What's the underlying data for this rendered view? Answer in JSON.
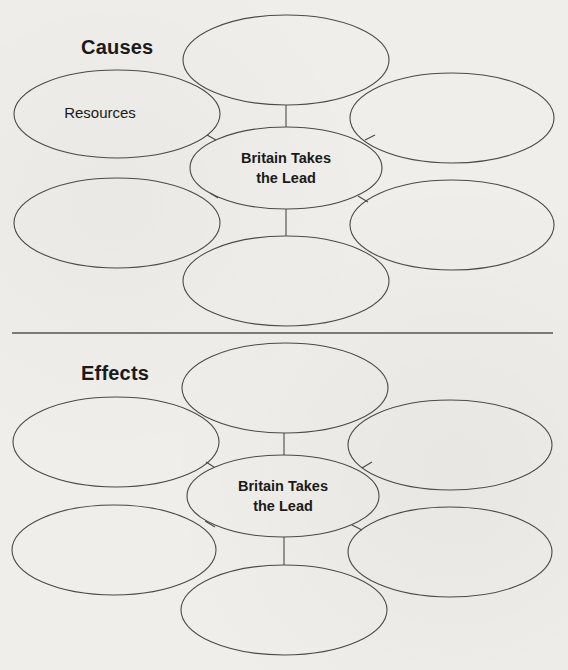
{
  "organizer": {
    "causes": {
      "title": "Causes",
      "center_label": "Britain Takes\nthe Lead",
      "nodes": [
        {
          "position": "top",
          "label": ""
        },
        {
          "position": "top-left",
          "label": "Resources"
        },
        {
          "position": "top-right",
          "label": ""
        },
        {
          "position": "bottom-left",
          "label": ""
        },
        {
          "position": "bottom-right",
          "label": ""
        },
        {
          "position": "bottom",
          "label": ""
        }
      ]
    },
    "effects": {
      "title": "Effects",
      "center_label": "Britain Takes\nthe Lead",
      "nodes": [
        {
          "position": "top",
          "label": ""
        },
        {
          "position": "top-left",
          "label": ""
        },
        {
          "position": "top-right",
          "label": ""
        },
        {
          "position": "bottom-left",
          "label": ""
        },
        {
          "position": "bottom-right",
          "label": ""
        },
        {
          "position": "bottom",
          "label": ""
        }
      ]
    },
    "colors": {
      "background": "#efeeea",
      "stroke": "#4a4a4a",
      "text": "#1a1a1a"
    }
  }
}
